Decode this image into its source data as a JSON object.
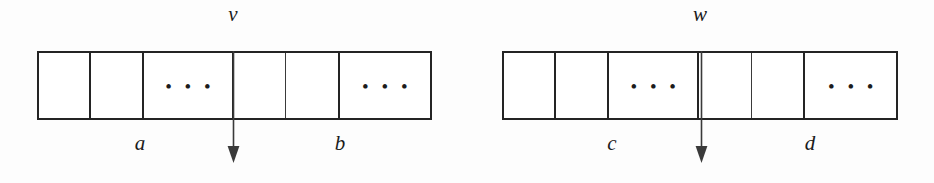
{
  "figure": {
    "background_color": "#fdfdfd",
    "line_color": "#242424",
    "text_color": "#1b1b1b",
    "ellipsis_glyph": "• • •"
  },
  "arrays": [
    {
      "id": "left",
      "top_label": "v",
      "bottom_labels": {
        "left": "a",
        "right": "b"
      },
      "arrow": {
        "direction": "down",
        "points_at": "split-between-cell-4-and-cell-5"
      },
      "cells": [
        {
          "index": 0,
          "content": ""
        },
        {
          "index": 1,
          "content": ""
        },
        {
          "index": 2,
          "content": "• • •"
        },
        {
          "index": 3,
          "content": ""
        },
        {
          "index": 4,
          "content": ""
        },
        {
          "index": 5,
          "content": "• • •"
        }
      ]
    },
    {
      "id": "right",
      "top_label": "w",
      "bottom_labels": {
        "left": "c",
        "right": "d"
      },
      "arrow": {
        "direction": "down",
        "points_at": "split-between-cell-4-and-cell-5"
      },
      "cells": [
        {
          "index": 0,
          "content": ""
        },
        {
          "index": 1,
          "content": ""
        },
        {
          "index": 2,
          "content": "• • •"
        },
        {
          "index": 3,
          "content": ""
        },
        {
          "index": 4,
          "content": ""
        },
        {
          "index": 5,
          "content": "• • •"
        }
      ]
    }
  ]
}
